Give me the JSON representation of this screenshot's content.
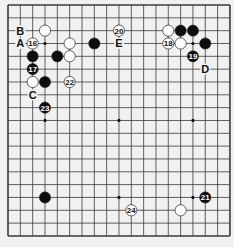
{
  "board": {
    "size": 19,
    "origin_x": 8,
    "origin_y": 5,
    "step_x": 12.33,
    "step_y": 12.83,
    "background": "#f1f1f1",
    "line_color": "#3a3a3a",
    "stone_radius": 5.6
  },
  "star_points": [
    [
      3,
      3
    ],
    [
      9,
      3
    ],
    [
      15,
      3
    ],
    [
      3,
      9
    ],
    [
      9,
      9
    ],
    [
      15,
      9
    ],
    [
      3,
      15
    ],
    [
      9,
      15
    ],
    [
      15,
      15
    ]
  ],
  "stones": [
    {
      "color": "white",
      "col": 3,
      "row": 2,
      "label": ""
    },
    {
      "color": "white",
      "col": 2,
      "row": 3,
      "label": "16"
    },
    {
      "color": "white",
      "col": 5,
      "row": 3,
      "label": ""
    },
    {
      "color": "black",
      "col": 7,
      "row": 3,
      "label": ""
    },
    {
      "color": "black",
      "col": 2,
      "row": 4,
      "label": ""
    },
    {
      "color": "black",
      "col": 4,
      "row": 4,
      "label": ""
    },
    {
      "color": "white",
      "col": 5,
      "row": 4,
      "label": ""
    },
    {
      "color": "black",
      "col": 2,
      "row": 5,
      "label": "17"
    },
    {
      "color": "white",
      "col": 2,
      "row": 6,
      "label": ""
    },
    {
      "color": "black",
      "col": 3,
      "row": 6,
      "label": ""
    },
    {
      "color": "white",
      "col": 5,
      "row": 6,
      "label": "22"
    },
    {
      "color": "black",
      "col": 3,
      "row": 8,
      "label": "23"
    },
    {
      "color": "white",
      "col": 9,
      "row": 2,
      "label": "20"
    },
    {
      "color": "white",
      "col": 13,
      "row": 2,
      "label": ""
    },
    {
      "color": "black",
      "col": 14,
      "row": 2,
      "label": ""
    },
    {
      "color": "black",
      "col": 15,
      "row": 2,
      "label": ""
    },
    {
      "color": "white",
      "col": 13,
      "row": 3,
      "label": "18"
    },
    {
      "color": "white",
      "col": 14,
      "row": 3,
      "label": ""
    },
    {
      "color": "black",
      "col": 16,
      "row": 3,
      "label": ""
    },
    {
      "color": "black",
      "col": 15,
      "row": 4,
      "label": "19"
    },
    {
      "color": "black",
      "col": 3,
      "row": 15,
      "label": ""
    },
    {
      "color": "white",
      "col": 10,
      "row": 16,
      "label": "24"
    },
    {
      "color": "white",
      "col": 14,
      "row": 16,
      "label": ""
    },
    {
      "color": "black",
      "col": 16,
      "row": 15,
      "label": "21"
    }
  ],
  "letters": [
    {
      "text": "B",
      "col": 1,
      "row": 2
    },
    {
      "text": "A",
      "col": 1,
      "row": 3
    },
    {
      "text": "C",
      "col": 2,
      "row": 7
    },
    {
      "text": "E",
      "col": 9,
      "row": 3
    },
    {
      "text": "D",
      "col": 16,
      "row": 5
    }
  ]
}
